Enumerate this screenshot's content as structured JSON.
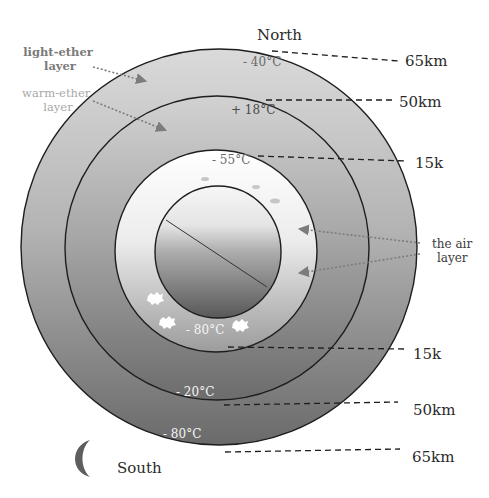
{
  "diagram": {
    "directions": {
      "north": "North",
      "south": "South"
    },
    "layer_labels": {
      "light_ether": [
        "light-ether",
        "layer"
      ],
      "warm_ether": [
        "warm-ether",
        "layer"
      ],
      "air": [
        "the air",
        "layer"
      ]
    },
    "altitudes_north": [
      {
        "label": "65km",
        "boundary": "outer circle"
      },
      {
        "label": "50km",
        "boundary": "second circle"
      },
      {
        "label": "15k",
        "boundary": "air layer circle"
      }
    ],
    "altitudes_south": [
      {
        "label": "15k",
        "boundary": "air layer circle"
      },
      {
        "label": "50km",
        "boundary": "second circle"
      },
      {
        "label": "65km",
        "boundary": "outer circle"
      }
    ],
    "temperatures_north": [
      {
        "label": "- 40°C",
        "layer": "light-ether layer"
      },
      {
        "label": "+ 18°C",
        "layer": "warm-ether layer"
      },
      {
        "label": "- 55°C",
        "layer": "air layer"
      }
    ],
    "temperatures_south": [
      {
        "label": "- 80°C",
        "layer": "air layer"
      },
      {
        "label": "- 20°C",
        "layer": "warm-ether layer"
      },
      {
        "label": "- 80°C",
        "layer": "light-ether layer"
      }
    ],
    "icons": {
      "moon": "crescent-moon-icon",
      "clouds": "cloud-icon"
    },
    "colors": {
      "outline": "#1e1e1e",
      "outer_top": "#d6d6d6",
      "outer_bottom": "#6e6e6e",
      "air_top": "#ffffff",
      "air_bottom": "#9a9a9a",
      "core_top": "#f4f4f4",
      "core_bottom": "#5a5a5a",
      "arrow": "#7c7c7c",
      "moon": "#5e5e5e"
    }
  }
}
